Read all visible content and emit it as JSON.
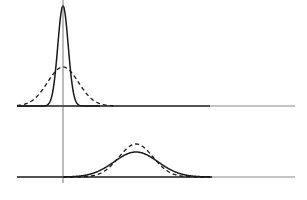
{
  "chart_data": [
    {
      "type": "line",
      "title": "",
      "panel": "top",
      "xlabel": "",
      "ylabel": "",
      "grid": false,
      "legend": null,
      "x_axis_origin_px": 63,
      "baseline_y_px": 106,
      "series": [
        {
          "name": "narrow distribution (solid)",
          "style": "solid",
          "center": 0,
          "relative_sigma": 0.33,
          "relative_peak": 1.0
        },
        {
          "name": "wide distribution (dashed)",
          "style": "dashed",
          "center": 0,
          "relative_sigma": 1.0,
          "relative_peak": 0.39
        }
      ]
    },
    {
      "type": "line",
      "title": "",
      "panel": "bottom",
      "xlabel": "",
      "ylabel": "",
      "grid": false,
      "legend": null,
      "x_axis_origin_px": 63,
      "baseline_y_px": 177,
      "series": [
        {
          "name": "broad shifted distribution (solid)",
          "style": "solid",
          "center": 73,
          "relative_sigma": 1.3,
          "relative_peak": 0.26
        },
        {
          "name": "shifted distribution (dashed)",
          "style": "dashed",
          "center": 73,
          "relative_sigma": 1.0,
          "relative_peak": 0.33
        }
      ]
    }
  ],
  "colors": {
    "line": "#1a1a1a",
    "axis": "#555555",
    "baseline_faint": "#888888",
    "background": "#ffffff"
  },
  "geometry": {
    "vertical_axis_x": 63,
    "vertical_axis_top": 0,
    "vertical_axis_bottom": 183,
    "baseline_left": 17,
    "baseline_dark_right": 210,
    "baseline_right": 295,
    "top": {
      "baseline": 106,
      "solid_peak_y": 6,
      "solid_sigma": 5.2,
      "dashed_peak_y": 67,
      "dashed_sigma": 15.5,
      "center_x": 63
    },
    "bottom": {
      "baseline": 177,
      "solid_peak_y": 152,
      "solid_sigma": 22,
      "dashed_peak_y": 144,
      "dashed_sigma": 17,
      "center_x": 136
    }
  }
}
